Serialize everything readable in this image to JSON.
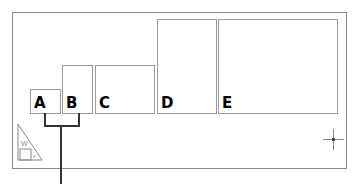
{
  "diagram": {
    "boxes": [
      {
        "id": "A",
        "label": "A"
      },
      {
        "id": "B",
        "label": "B"
      },
      {
        "id": "C",
        "label": "C"
      },
      {
        "id": "D",
        "label": "D"
      },
      {
        "id": "E",
        "label": "E"
      }
    ],
    "bracket": {
      "connects": [
        "A",
        "B"
      ]
    },
    "icons": {
      "corner_icon": "triangle-ruler-icon",
      "corner_icon_text_w": "W",
      "corner_icon_text_x": "x",
      "cursor_icon": "crosshair-icon"
    },
    "colors": {
      "frame": "#8a8a8a",
      "box_border": "#9a9a9a",
      "bracket": "#333333",
      "label": "#000000"
    }
  }
}
